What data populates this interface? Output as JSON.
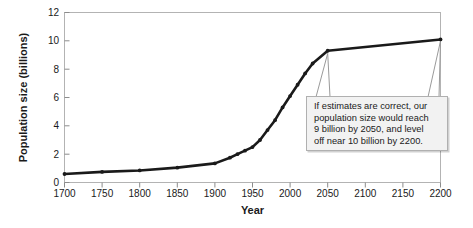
{
  "chart_data": {
    "type": "line",
    "title": "",
    "xlabel": "Year",
    "ylabel": "Population size (billions)",
    "xlim": [
      1700,
      2200
    ],
    "ylim": [
      0,
      12
    ],
    "xticks": [
      1700,
      1750,
      1800,
      1850,
      1900,
      1950,
      2000,
      2050,
      2100,
      2150,
      2200
    ],
    "yticks": [
      0,
      2,
      4,
      6,
      8,
      10,
      12
    ],
    "xtick_labels": [
      "1700",
      "1750",
      "1800",
      "1850",
      "1900",
      "1950",
      "2000",
      "2050",
      "2100",
      "2150",
      "2200"
    ],
    "ytick_labels": [
      "0",
      "2",
      "4",
      "6",
      "8",
      "10",
      "12"
    ],
    "grid": false,
    "legend": "none",
    "series": [
      {
        "name": "World population",
        "x": [
          1700,
          1750,
          1800,
          1850,
          1900,
          1920,
          1930,
          1940,
          1950,
          1960,
          1970,
          1980,
          1990,
          2000,
          2010,
          2020,
          2030,
          2050,
          2200
        ],
        "values": [
          0.6,
          0.75,
          0.85,
          1.05,
          1.35,
          1.75,
          2.0,
          2.25,
          2.5,
          3.0,
          3.7,
          4.4,
          5.3,
          6.1,
          6.9,
          7.7,
          8.4,
          9.3,
          10.1
        ]
      }
    ],
    "annotations": [
      {
        "name": "forecast-callout",
        "text": "If estimates are correct, our\npopulation size would reach\n9 billion by 2050, and level\noff near 10 billion by 2200.",
        "points_to": [
          2050,
          2200
        ]
      }
    ],
    "colors": {
      "line": "#1a1a1a",
      "axis": "#b3b3b3",
      "text": "#1a1a1a",
      "callout_background": "#f2f2f2",
      "callout_border": "#b0b0b0",
      "leader_line": "#9a9a9a"
    }
  }
}
